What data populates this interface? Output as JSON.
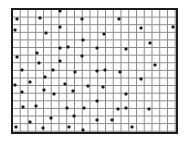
{
  "figure": {
    "grid": {
      "columns": 21,
      "rows": 16
    },
    "colors": {
      "border": "#1e1e1e",
      "gridline": "#8a8a8a",
      "dot": "#1a1a1a",
      "background": "#fdfdfd"
    }
  },
  "dots": [
    {
      "x": 60,
      "y": 11
    },
    {
      "x": 17,
      "y": 19
    },
    {
      "x": 40,
      "y": 18
    },
    {
      "x": 82,
      "y": 19
    },
    {
      "x": 119,
      "y": 19
    },
    {
      "x": 15,
      "y": 30
    },
    {
      "x": 60,
      "y": 27
    },
    {
      "x": 141,
      "y": 28
    },
    {
      "x": 173,
      "y": 27
    },
    {
      "x": 46,
      "y": 33
    },
    {
      "x": 104,
      "y": 34
    },
    {
      "x": 83,
      "y": 40
    },
    {
      "x": 150,
      "y": 43
    },
    {
      "x": 60,
      "y": 48
    },
    {
      "x": 68,
      "y": 47
    },
    {
      "x": 97,
      "y": 48
    },
    {
      "x": 126,
      "y": 49
    },
    {
      "x": 17,
      "y": 57
    },
    {
      "x": 37,
      "y": 53
    },
    {
      "x": 82,
      "y": 56
    },
    {
      "x": 39,
      "y": 63
    },
    {
      "x": 60,
      "y": 61
    },
    {
      "x": 155,
      "y": 65
    },
    {
      "x": 22,
      "y": 70
    },
    {
      "x": 53,
      "y": 70
    },
    {
      "x": 75,
      "y": 72
    },
    {
      "x": 97,
      "y": 71
    },
    {
      "x": 105,
      "y": 70
    },
    {
      "x": 120,
      "y": 72
    },
    {
      "x": 45,
      "y": 77
    },
    {
      "x": 141,
      "y": 79
    },
    {
      "x": 15,
      "y": 85
    },
    {
      "x": 30,
      "y": 82
    },
    {
      "x": 65,
      "y": 84
    },
    {
      "x": 88,
      "y": 86
    },
    {
      "x": 103,
      "y": 87
    },
    {
      "x": 22,
      "y": 92
    },
    {
      "x": 44,
      "y": 90
    },
    {
      "x": 54,
      "y": 94
    },
    {
      "x": 73,
      "y": 91
    },
    {
      "x": 126,
      "y": 94
    },
    {
      "x": 97,
      "y": 101
    },
    {
      "x": 23,
      "y": 107
    },
    {
      "x": 36,
      "y": 106
    },
    {
      "x": 67,
      "y": 108
    },
    {
      "x": 84,
      "y": 108
    },
    {
      "x": 118,
      "y": 109
    },
    {
      "x": 126,
      "y": 108
    },
    {
      "x": 149,
      "y": 109
    },
    {
      "x": 51,
      "y": 118
    },
    {
      "x": 74,
      "y": 116
    },
    {
      "x": 97,
      "y": 120
    },
    {
      "x": 112,
      "y": 120
    },
    {
      "x": 30,
      "y": 122
    },
    {
      "x": 16,
      "y": 127
    },
    {
      "x": 43,
      "y": 128
    },
    {
      "x": 69,
      "y": 127
    },
    {
      "x": 83,
      "y": 130
    },
    {
      "x": 132,
      "y": 127
    }
  ]
}
